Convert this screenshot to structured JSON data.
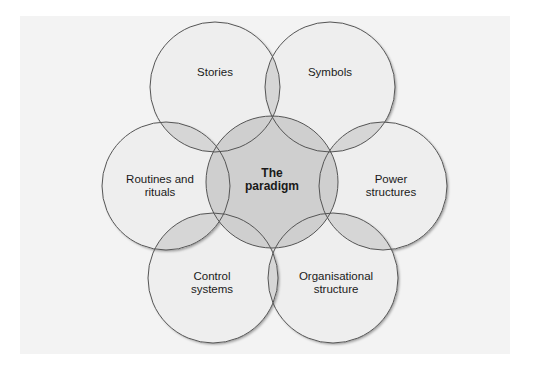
{
  "diagram": {
    "title": "The paradigm",
    "colors": {
      "panel_bg": "#f3f3f3",
      "outer_fill": "#eeeeee",
      "overlap_fill": "#d6d6d6",
      "center_fill": "#cfcfcf",
      "stroke": "#555555",
      "text": "#1a1a1a"
    },
    "center": {
      "line1": "The",
      "line2": "paradigm",
      "cx": 272,
      "cy": 182,
      "r": 66
    },
    "elements": [
      {
        "id": "stories",
        "line1": "Stories",
        "line2": "",
        "cx": 215,
        "cy": 87,
        "r": 65
      },
      {
        "id": "symbols",
        "line1": "Symbols",
        "line2": "",
        "cx": 330,
        "cy": 87,
        "r": 65
      },
      {
        "id": "power-structures",
        "line1": "Power",
        "line2": "structures",
        "cx": 383,
        "cy": 186,
        "r": 64
      },
      {
        "id": "organisational-structure",
        "line1": "Organisational",
        "line2": "structure",
        "cx": 333,
        "cy": 278,
        "r": 65
      },
      {
        "id": "control-systems",
        "line1": "Control",
        "line2": "systems",
        "cx": 213,
        "cy": 278,
        "r": 65
      },
      {
        "id": "routines-and-rituals",
        "line1": "Routines and",
        "line2": "rituals",
        "cx": 166,
        "cy": 186,
        "r": 64
      }
    ]
  }
}
